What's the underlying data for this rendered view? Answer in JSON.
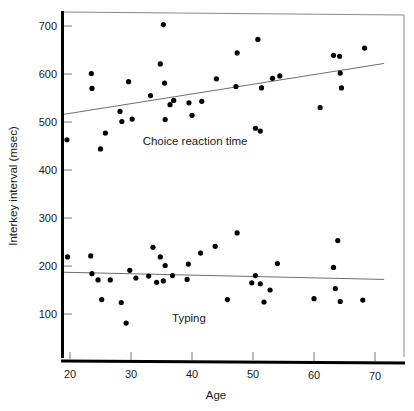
{
  "chart_data": {
    "type": "scatter",
    "title": "",
    "xlabel": "Age",
    "ylabel": "Interkey interval (msec)",
    "xlim": [
      18,
      72
    ],
    "ylim": [
      40,
      730
    ],
    "xticks": [
      20,
      30,
      40,
      50,
      60,
      70
    ],
    "yticks": [
      100,
      200,
      300,
      400,
      500,
      600,
      700
    ],
    "xtick_labels": [
      "20",
      "30",
      "40",
      "50",
      "60",
      "70"
    ],
    "ytick_labels": [
      "100",
      "200",
      "300",
      "400",
      "500",
      "600",
      "700"
    ],
    "grid": false,
    "legend_position": "inline-annotation",
    "series": [
      {
        "name": "Choice reaction time",
        "annotation_label": "Choice reaction time",
        "annotation_x": 40.5,
        "annotation_y": 452,
        "marker": "filled-circle",
        "color": "#000000",
        "points": [
          [
            19.5,
            463
          ],
          [
            23.5,
            601
          ],
          [
            23.6,
            570
          ],
          [
            25.0,
            444
          ],
          [
            25.8,
            477
          ],
          [
            28.2,
            522
          ],
          [
            28.5,
            501
          ],
          [
            29.6,
            584
          ],
          [
            30.2,
            506
          ],
          [
            33.2,
            555
          ],
          [
            34.8,
            621
          ],
          [
            35.3,
            703
          ],
          [
            35.5,
            581
          ],
          [
            35.6,
            505
          ],
          [
            36.4,
            536
          ],
          [
            37.0,
            545
          ],
          [
            39.5,
            540
          ],
          [
            40.0,
            514
          ],
          [
            41.6,
            543
          ],
          [
            44.0,
            590
          ],
          [
            47.2,
            574
          ],
          [
            47.4,
            644
          ],
          [
            50.4,
            487
          ],
          [
            50.8,
            672
          ],
          [
            51.2,
            481
          ],
          [
            51.4,
            571
          ],
          [
            53.2,
            591
          ],
          [
            54.4,
            596
          ],
          [
            61.0,
            530
          ],
          [
            63.2,
            639
          ],
          [
            64.2,
            637
          ],
          [
            64.3,
            602
          ],
          [
            64.5,
            571
          ],
          [
            68.3,
            654
          ]
        ],
        "trend_line": {
          "x_start": 19,
          "y_start": 516,
          "x_end": 71.5,
          "y_end": 622
        }
      },
      {
        "name": "Typing",
        "annotation_label": "Typing",
        "annotation_x": 39.5,
        "annotation_y": 84,
        "marker": "filled-circle",
        "color": "#000000",
        "points": [
          [
            19.6,
            219
          ],
          [
            23.4,
            221
          ],
          [
            23.6,
            184
          ],
          [
            24.6,
            171
          ],
          [
            25.2,
            130
          ],
          [
            26.6,
            171
          ],
          [
            28.4,
            124
          ],
          [
            29.2,
            81
          ],
          [
            29.8,
            191
          ],
          [
            30.8,
            175
          ],
          [
            32.9,
            179
          ],
          [
            33.6,
            239
          ],
          [
            34.2,
            166
          ],
          [
            34.8,
            219
          ],
          [
            35.3,
            169
          ],
          [
            35.6,
            201
          ],
          [
            36.8,
            180
          ],
          [
            39.2,
            172
          ],
          [
            39.4,
            204
          ],
          [
            41.4,
            227
          ],
          [
            43.8,
            241
          ],
          [
            45.8,
            130
          ],
          [
            47.4,
            269
          ],
          [
            49.8,
            165
          ],
          [
            50.4,
            180
          ],
          [
            51.2,
            163
          ],
          [
            51.8,
            125
          ],
          [
            52.8,
            150
          ],
          [
            54.0,
            205
          ],
          [
            60.0,
            132
          ],
          [
            63.2,
            197
          ],
          [
            63.5,
            153
          ],
          [
            63.9,
            253
          ],
          [
            64.3,
            126
          ],
          [
            68.0,
            129
          ]
        ],
        "trend_line": {
          "x_start": 19,
          "y_start": 187,
          "x_end": 71.5,
          "y_end": 172
        }
      }
    ]
  },
  "axes": {
    "x_title": "Age",
    "y_title": "Interkey interval (msec)"
  }
}
